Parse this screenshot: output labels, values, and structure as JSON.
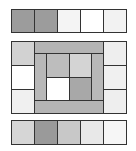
{
  "diagram": {
    "top_row": {
      "cells": [
        {
          "x": 11,
          "y": 9,
          "w": 24,
          "h": 24,
          "color": "#9c9c9c"
        },
        {
          "x": 34,
          "y": 9,
          "w": 24,
          "h": 24,
          "color": "#9c9c9c"
        },
        {
          "x": 57,
          "y": 9,
          "w": 24,
          "h": 24,
          "color": "#f4f4f4"
        },
        {
          "x": 80,
          "y": 9,
          "w": 24,
          "h": 24,
          "color": "#ffffff"
        },
        {
          "x": 103,
          "y": 9,
          "w": 24,
          "h": 24,
          "color": "#f2f2f2"
        }
      ]
    },
    "middle_block": {
      "cells": [
        {
          "name": "left-top",
          "x": 11,
          "y": 41,
          "w": 24,
          "h": 25,
          "color": "#d2d2d2"
        },
        {
          "name": "left-middle",
          "x": 11,
          "y": 65,
          "w": 24,
          "h": 25,
          "color": "#ffffff"
        },
        {
          "name": "left-bottom",
          "x": 11,
          "y": 89,
          "w": 24,
          "h": 25,
          "color": "#f0f0f0"
        },
        {
          "name": "right-top",
          "x": 103,
          "y": 41,
          "w": 24,
          "h": 25,
          "color": "#eeeeee"
        },
        {
          "name": "right-middle",
          "x": 103,
          "y": 65,
          "w": 24,
          "h": 25,
          "color": "#f0f0f0"
        },
        {
          "name": "right-bottom",
          "x": 103,
          "y": 89,
          "w": 24,
          "h": 25,
          "color": "#eeeeee"
        },
        {
          "name": "frame-top-bar",
          "x": 34,
          "y": 41,
          "w": 70,
          "h": 13,
          "color": "#b4b4b4"
        },
        {
          "name": "frame-bottom-bar",
          "x": 34,
          "y": 100,
          "w": 70,
          "h": 14,
          "color": "#b4b4b4"
        },
        {
          "name": "frame-left-strip",
          "x": 34,
          "y": 53,
          "w": 13,
          "h": 48,
          "color": "#b8b8b8"
        },
        {
          "name": "frame-right-strip",
          "x": 91,
          "y": 53,
          "w": 13,
          "h": 48,
          "color": "#b8b8b8"
        },
        {
          "name": "inner-top-left",
          "x": 46,
          "y": 53,
          "w": 24,
          "h": 25,
          "color": "#bdbdbd"
        },
        {
          "name": "inner-top-right",
          "x": 69,
          "y": 53,
          "w": 23,
          "h": 25,
          "color": "#d4d4d4"
        },
        {
          "name": "inner-bottom-left",
          "x": 46,
          "y": 77,
          "w": 24,
          "h": 24,
          "color": "#ffffff"
        },
        {
          "name": "inner-bottom-right",
          "x": 69,
          "y": 77,
          "w": 23,
          "h": 24,
          "color": "#a8a8a8"
        }
      ]
    },
    "bottom_row": {
      "cells": [
        {
          "x": 11,
          "y": 120,
          "w": 24,
          "h": 25,
          "color": "#d6d6d6"
        },
        {
          "x": 34,
          "y": 120,
          "w": 24,
          "h": 25,
          "color": "#9a9a9a"
        },
        {
          "x": 57,
          "y": 120,
          "w": 24,
          "h": 25,
          "color": "#c8c8c8"
        },
        {
          "x": 80,
          "y": 120,
          "w": 24,
          "h": 25,
          "color": "#e8e8e8"
        },
        {
          "x": 103,
          "y": 120,
          "w": 24,
          "h": 25,
          "color": "#f6f6f6"
        }
      ]
    },
    "border_color": "#333333"
  }
}
